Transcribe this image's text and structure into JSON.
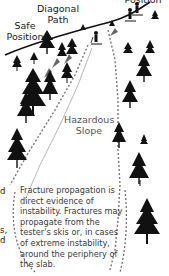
{
  "diagram": {
    "labels": {
      "top_right": "Position",
      "diagonal_path": [
        "Diagonal",
        "Path"
      ],
      "safe_position": [
        "Safe",
        "Position"
      ],
      "hazardous_slope": [
        "Hazardous",
        "Slope"
      ]
    },
    "caption": "Fracture propagation is direct evidence of instability. Fractures may propagate from the tester's skis or, in cases of extreme instability, around the periphery of the slab.",
    "edge_fragments": [
      "d",
      "s,",
      "d"
    ],
    "colors": {
      "ink": "#111111",
      "caption_text": "#3a3a3a",
      "label_gray": "#555555",
      "arrow_gray": "#666666",
      "background": "#ffffff"
    }
  }
}
